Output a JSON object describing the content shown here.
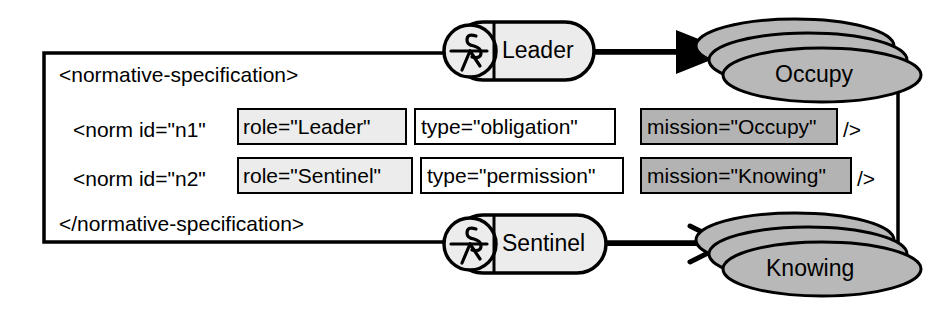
{
  "diagram": {
    "title": "normative-specification",
    "open_tag": "<normative-specification>",
    "close_tag": "</normative-specification>",
    "self_close": "/>",
    "norms": [
      {
        "prefix": "<norm id=\"n1\"",
        "role_attr": "role=\"Leader\"",
        "type_attr": "type=\"obligation\"",
        "mission_attr": "mission=\"Occupy\"",
        "suffix": "/>"
      },
      {
        "prefix": "<norm id=\"n2\"",
        "role_attr": "role=\"Sentinel\"",
        "type_attr": "type=\"permission\"",
        "mission_attr": "mission=\"Knowing\"",
        "suffix": "/>"
      }
    ],
    "roles": [
      {
        "label": "Leader",
        "icon": "role-actor-icon"
      },
      {
        "label": "Sentinel",
        "icon": "role-actor-icon"
      }
    ],
    "missions": [
      {
        "label": "Occupy",
        "arrow": "filled-triangle"
      },
      {
        "label": "Knowing",
        "arrow": "open-arrow"
      }
    ],
    "colors": {
      "stroke": "#000000",
      "role_box_fill": "#ececec",
      "type_box_fill": "#ffffff",
      "mission_box_fill": "#b3b3b3",
      "mission_node_fill": "#b8b8b8",
      "role_node_fill": "#ececec",
      "background": "#ffffff"
    }
  }
}
